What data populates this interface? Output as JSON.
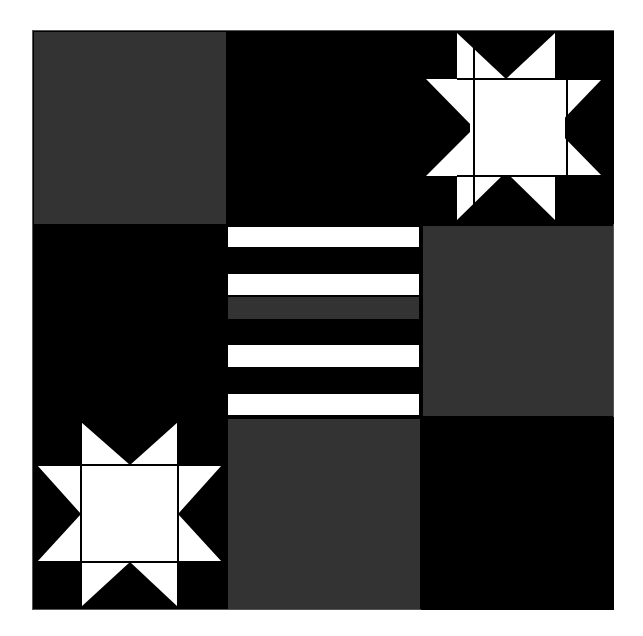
{
  "colors": {
    "black": "#000000",
    "gray": "#333333",
    "white": "#ffffff",
    "background": "#ffffff"
  },
  "grid": {
    "rows": 3,
    "cols": 3,
    "cells": [
      {
        "row": 0,
        "col": 0,
        "type": "solid",
        "color": "gray"
      },
      {
        "row": 0,
        "col": 1,
        "type": "solid",
        "color": "black"
      },
      {
        "row": 0,
        "col": 2,
        "type": "star",
        "color": "white-on-black"
      },
      {
        "row": 1,
        "col": 0,
        "type": "solid",
        "color": "black"
      },
      {
        "row": 1,
        "col": 1,
        "type": "stripes",
        "stripes": [
          "white",
          "black",
          "white",
          "gray",
          "black",
          "white",
          "black",
          "white"
        ]
      },
      {
        "row": 1,
        "col": 2,
        "type": "solid",
        "color": "gray"
      },
      {
        "row": 2,
        "col": 0,
        "type": "star",
        "color": "white-on-black"
      },
      {
        "row": 2,
        "col": 1,
        "type": "solid",
        "color": "gray"
      },
      {
        "row": 2,
        "col": 2,
        "type": "solid",
        "color": "black"
      }
    ]
  }
}
